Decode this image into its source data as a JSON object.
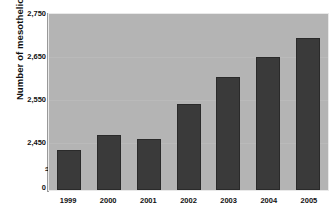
{
  "chart_data": {
    "type": "bar",
    "title": "",
    "xlabel": "",
    "ylabel": "Number of mesothelioma deaths",
    "categories": [
      "1999",
      "2000",
      "2001",
      "2002",
      "2003",
      "2004",
      "2005"
    ],
    "values": [
      2430,
      2465,
      2455,
      2535,
      2600,
      2645,
      2690
    ],
    "ylim": [
      2400,
      2750
    ],
    "y_axis_has_break": true,
    "y_axis_break_symbol": "≈",
    "ytick_labels": [
      "2,750",
      "2,650",
      "2,550",
      "2,450",
      "0"
    ],
    "ytick_values": [
      2750,
      2650,
      2550,
      2450,
      0
    ],
    "grid": true,
    "legend": "none",
    "colors": {
      "bar": "#3a3a3a",
      "plot_background": "#b4b4b4",
      "figure_background": "#ffffff",
      "gridline": "#c0c0c0",
      "text": "#111111",
      "axis_line": "#9a9a9a"
    }
  },
  "axis": {
    "y_title": "Number of mesothelioma deaths",
    "break_symbol": "≈",
    "ticks_y": [
      {
        "label": "2,750"
      },
      {
        "label": "2,650"
      },
      {
        "label": "2,550"
      },
      {
        "label": "2,450"
      },
      {
        "label": "0"
      }
    ],
    "ticks_x": [
      {
        "label": "1999"
      },
      {
        "label": "2000"
      },
      {
        "label": "2001"
      },
      {
        "label": "2002"
      },
      {
        "label": "2003"
      },
      {
        "label": "2004"
      },
      {
        "label": "2005"
      }
    ]
  }
}
